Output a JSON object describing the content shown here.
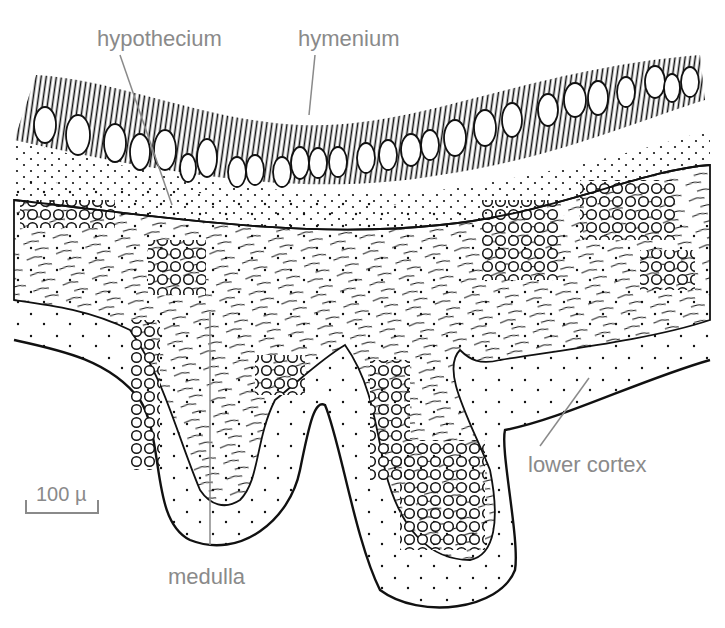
{
  "figure": {
    "colors": {
      "ink": "#111111",
      "label": "#8a8a8a",
      "background": "#ffffff"
    }
  },
  "labels": {
    "hypothecium": {
      "text": "hypothecium",
      "x": 97,
      "y": 28
    },
    "hymenium": {
      "text": "hymenium",
      "x": 298,
      "y": 28
    },
    "lower_cortex": {
      "text": "lower cortex",
      "x": 528,
      "y": 454
    },
    "medulla": {
      "text": "medulla",
      "x": 168,
      "y": 568
    }
  },
  "scale_bar": {
    "text": "100 µ",
    "x1": 26,
    "x2": 98,
    "y": 513
  }
}
